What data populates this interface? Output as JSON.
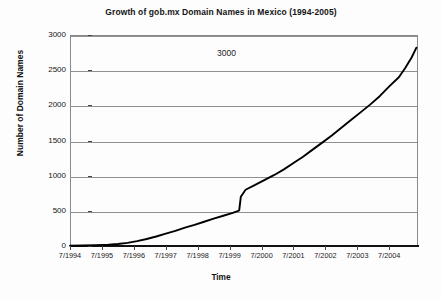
{
  "chart_data": {
    "type": "line",
    "title": "Growth of gob.mx Domain Names in Mexico (1994-2005)",
    "xlabel": "Time",
    "ylabel": "Number of Domain Names",
    "grid": true,
    "legend": "none",
    "xlim": [
      1994.5,
      2005.4
    ],
    "ylim": [
      0,
      3000
    ],
    "ytick_labels": [
      "3000",
      "2500",
      "2000",
      "1500",
      "1000",
      "500",
      "0"
    ],
    "ytick_values": [
      3000,
      2500,
      2000,
      1500,
      1000,
      500,
      0
    ],
    "xtick_labels": [
      "7/1994",
      "7/1995",
      "7/1996",
      "7/1997",
      "7/1998",
      "7/1999",
      "7/2000",
      "7/2001",
      "7/2002",
      "7/2003",
      "7/2004"
    ],
    "xtick_values": [
      1994.5,
      1995.5,
      1996.5,
      1997.5,
      1998.5,
      1999.5,
      2000.5,
      2001.5,
      2002.5,
      2003.5,
      2004.5
    ],
    "annotations": [
      {
        "text": "3000",
        "x": 1999.4,
        "y": 2750
      }
    ],
    "series": [
      {
        "name": "gob.mx domain names",
        "color": "#000000",
        "x": [
          1994.5,
          1994.9,
          1995.3,
          1995.7,
          1996.0,
          1996.3,
          1996.6,
          1996.9,
          1997.2,
          1997.5,
          1997.8,
          1998.1,
          1998.4,
          1998.7,
          1999.0,
          1999.3,
          1999.6,
          1999.75,
          1999.8,
          1999.85,
          2000.0,
          2000.3,
          2000.6,
          2000.9,
          2001.2,
          2001.5,
          2001.8,
          2002.1,
          2002.4,
          2002.7,
          2003.0,
          2003.3,
          2003.6,
          2003.9,
          2004.2,
          2004.5,
          2004.8,
          2005.0,
          2005.2,
          2005.35
        ],
        "values": [
          5,
          8,
          12,
          18,
          28,
          45,
          70,
          100,
          135,
          175,
          215,
          260,
          300,
          345,
          390,
          430,
          470,
          495,
          505,
          700,
          800,
          870,
          940,
          1010,
          1090,
          1180,
          1270,
          1370,
          1470,
          1570,
          1680,
          1790,
          1900,
          2010,
          2130,
          2270,
          2400,
          2530,
          2680,
          2820
        ]
      }
    ]
  }
}
